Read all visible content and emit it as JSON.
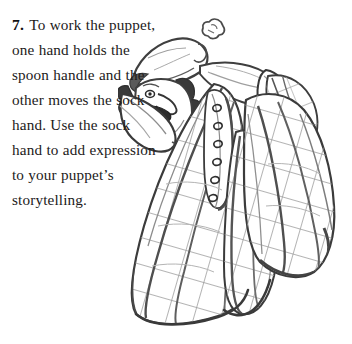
{
  "page": {
    "background_color": "#ffffff",
    "width": 352,
    "height": 344
  },
  "instruction": {
    "step_number": "7.",
    "body": "To work the puppet, one hand holds the spoon handle and the other moves the sock hand. Use the sock hand to add expression to your puppet’s storytelling.",
    "lines": [
      "To work the",
      "puppet, one hand",
      "holds the spoon",
      "handle and the other",
      "moves the sock",
      "hand. Use the",
      "sock hand to add",
      "expression to",
      "your puppet’s",
      "storytelling."
    ],
    "text_color": "#1c1a1a"
  },
  "illustration": {
    "caption": "Pencil sketch of a hand puppet character wearing a pointed nightcap and a large crosshatched draping cloak, with one arm raised",
    "medium": "graphite pencil sketch",
    "line_color": "#4a4a4a",
    "shade_color": "#8d8d8d",
    "dark_color": "#2b2b2b",
    "parts": [
      {
        "name": "pom-pom",
        "label": "cap pom-pom"
      },
      {
        "name": "nightcap",
        "label": "pointed nightcap"
      },
      {
        "name": "hair",
        "label": "spiky hair tufts"
      },
      {
        "name": "face",
        "label": "profile face with long nose"
      },
      {
        "name": "mustache",
        "label": "dark mustache and open mouth"
      },
      {
        "name": "eye",
        "label": "eye"
      },
      {
        "name": "collar",
        "label": "white pointed collar"
      },
      {
        "name": "raised-arm",
        "label": "raised arm with cuff"
      },
      {
        "name": "cloak",
        "label": "crosshatched draping cloak"
      },
      {
        "name": "button-placket",
        "label": "row of buttons down the front"
      }
    ],
    "button_count": 6
  }
}
